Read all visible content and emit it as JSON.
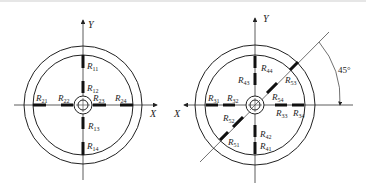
{
  "diagrams": [
    {
      "id": "left",
      "axes": {
        "x": "X",
        "y": "Y"
      },
      "gauges": [
        {
          "name": "R",
          "sub": "11"
        },
        {
          "name": "R",
          "sub": "12"
        },
        {
          "name": "R",
          "sub": "13"
        },
        {
          "name": "R",
          "sub": "14"
        },
        {
          "name": "R",
          "sub": "21"
        },
        {
          "name": "R",
          "sub": "22"
        },
        {
          "name": "R",
          "sub": "23"
        },
        {
          "name": "R",
          "sub": "24"
        }
      ]
    },
    {
      "id": "right",
      "axes": {
        "x": "X",
        "y": "Y"
      },
      "angle": "45°",
      "gauges": [
        {
          "name": "R",
          "sub": "31"
        },
        {
          "name": "R",
          "sub": "32"
        },
        {
          "name": "R",
          "sub": "33"
        },
        {
          "name": "R",
          "sub": "34"
        },
        {
          "name": "R",
          "sub": "41"
        },
        {
          "name": "R",
          "sub": "42"
        },
        {
          "name": "R",
          "sub": "43"
        },
        {
          "name": "R",
          "sub": "44"
        },
        {
          "name": "R",
          "sub": "51"
        },
        {
          "name": "R",
          "sub": "52"
        },
        {
          "name": "R",
          "sub": "53"
        },
        {
          "name": "R",
          "sub": "54"
        }
      ]
    }
  ]
}
